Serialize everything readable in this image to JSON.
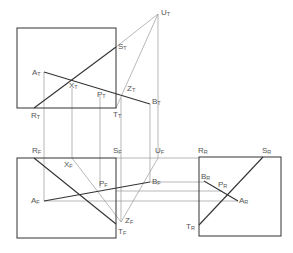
{
  "diagram": {
    "type": "orthographic-projection",
    "views": [
      "top",
      "front",
      "right"
    ],
    "colors": {
      "line": "#333333",
      "construction": "#999999",
      "label": "#555555"
    },
    "labels": [
      {
        "id": "UT",
        "base": "U",
        "sub": "T",
        "x": 161,
        "y": 9
      },
      {
        "id": "ST",
        "base": "S",
        "sub": "T",
        "x": 118,
        "y": 43
      },
      {
        "id": "AT",
        "base": "A",
        "sub": "T",
        "x": 32,
        "y": 69
      },
      {
        "id": "XT",
        "base": "X",
        "sub": "T",
        "x": 69,
        "y": 82
      },
      {
        "id": "ZT",
        "base": "Z",
        "sub": "T",
        "x": 127,
        "y": 85
      },
      {
        "id": "PT",
        "base": "P",
        "sub": "T",
        "x": 97,
        "y": 91
      },
      {
        "id": "BT",
        "base": "B",
        "sub": "T",
        "x": 152,
        "y": 98
      },
      {
        "id": "RT",
        "base": "R",
        "sub": "T",
        "x": 31,
        "y": 112
      },
      {
        "id": "TT",
        "base": "T",
        "sub": "T",
        "x": 113,
        "y": 111
      },
      {
        "id": "RF",
        "base": "R",
        "sub": "F",
        "x": 32,
        "y": 147
      },
      {
        "id": "SF",
        "base": "S",
        "sub": "F",
        "x": 113,
        "y": 147
      },
      {
        "id": "UF",
        "base": "U",
        "sub": "F",
        "x": 155,
        "y": 147
      },
      {
        "id": "RR",
        "base": "R",
        "sub": "R",
        "x": 198,
        "y": 147
      },
      {
        "id": "SR",
        "base": "S",
        "sub": "R",
        "x": 262,
        "y": 147
      },
      {
        "id": "XF",
        "base": "X",
        "sub": "F",
        "x": 64,
        "y": 161
      },
      {
        "id": "BF",
        "base": "B",
        "sub": "F",
        "x": 152,
        "y": 178
      },
      {
        "id": "BR",
        "base": "B",
        "sub": "R",
        "x": 201,
        "y": 173
      },
      {
        "id": "PF",
        "base": "P",
        "sub": "F",
        "x": 99,
        "y": 180
      },
      {
        "id": "PR",
        "base": "P",
        "sub": "R",
        "x": 218,
        "y": 181
      },
      {
        "id": "AF",
        "base": "A",
        "sub": "F",
        "x": 31,
        "y": 197
      },
      {
        "id": "AR",
        "base": "A",
        "sub": "R",
        "x": 239,
        "y": 197
      },
      {
        "id": "ZF",
        "base": "Z",
        "sub": "F",
        "x": 125,
        "y": 217
      },
      {
        "id": "TF",
        "base": "T",
        "sub": "F",
        "x": 118,
        "y": 228
      },
      {
        "id": "TR",
        "base": "T",
        "sub": "R",
        "x": 186,
        "y": 223
      }
    ]
  }
}
